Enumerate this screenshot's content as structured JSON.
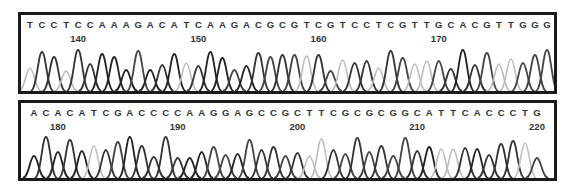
{
  "chromatograms": [
    {
      "sequence": "TCCTCCAAAGACATCAAGACGCGTCGTCCTCGTTGCACGTTGGG",
      "start_position": 136,
      "position_labels": [
        {
          "label": "140",
          "index": 4
        },
        {
          "label": "150",
          "index": 14
        },
        {
          "label": "160",
          "index": 24
        },
        {
          "label": "170",
          "index": 34
        }
      ],
      "first_x": 9,
      "last_x": 526
    },
    {
      "sequence": "ACACATCGACCCCAAGGAGCCGCTTCGCGCGGCATTCACCCTG",
      "start_position": 178,
      "position_labels": [
        {
          "label": "180",
          "index": 2
        },
        {
          "label": "190",
          "index": 12
        },
        {
          "label": "200",
          "index": 22
        },
        {
          "label": "210",
          "index": 32
        },
        {
          "label": "220",
          "index": 42
        }
      ],
      "first_x": 13,
      "last_x": 516
    }
  ],
  "colors": {
    "A": "#222222",
    "C": "#333333",
    "G": "#444444",
    "T": "#bdbdbd",
    "border": "#1a1a1a"
  }
}
